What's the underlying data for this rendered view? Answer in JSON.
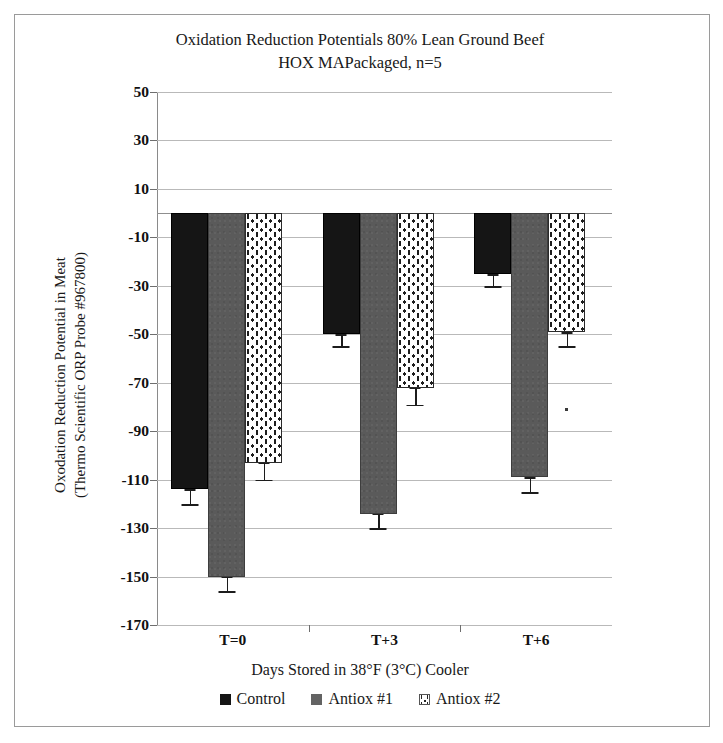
{
  "chart_data": {
    "type": "bar",
    "title": "Oxidation Reduction Potentials 80% Lean Ground Beef HOX MAPackaged, n=5",
    "title_line1": "Oxidation Reduction Potentials 80% Lean Ground Beef",
    "title_line2": "HOX MAPackaged, n=5",
    "xlabel": "Days Stored in 38°F (3°C) Cooler",
    "ylabel": "Oxodation Reduction Potential in Meat (Thermo Scientific ORP Probe #967800)",
    "ylabel_line1": "Oxodation Reduction Potential in Meat",
    "ylabel_line2": "(Thermo Scientific ORP Probe #967800)",
    "categories": [
      "T=0",
      "T+3",
      "T+6"
    ],
    "ylim": [
      -170,
      50
    ],
    "yticks": [
      50,
      30,
      10,
      -10,
      -30,
      -50,
      -70,
      -90,
      -110,
      -130,
      -150,
      -170
    ],
    "grid": true,
    "legend_position": "bottom",
    "series": [
      {
        "name": "Control",
        "color": "#151515",
        "pattern": "solid-black",
        "values": [
          -114,
          -50,
          -25
        ],
        "errors": [
          6,
          5,
          5
        ]
      },
      {
        "name": "Antiox #1",
        "color": "#5a5a5a",
        "pattern": "solid-gray",
        "values": [
          -150,
          -124,
          -109
        ],
        "errors": [
          6,
          6,
          6
        ]
      },
      {
        "name": "Antiox #2",
        "color": "#ffffff",
        "pattern": "dotted",
        "values": [
          -103,
          -72,
          -49
        ],
        "errors": [
          7,
          7,
          6
        ]
      }
    ]
  },
  "legend": {
    "items": [
      {
        "label": "Control",
        "swatch": "control"
      },
      {
        "label": "Antiox #1",
        "swatch": "antiox1"
      },
      {
        "label": "Antiox #2",
        "swatch": "antiox2"
      }
    ]
  }
}
